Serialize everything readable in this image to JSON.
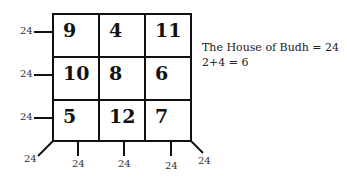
{
  "grid": {
    "cells": [
      [
        "9",
        "4",
        "11"
      ],
      [
        "10",
        "8",
        "6"
      ],
      [
        "5",
        "12",
        "7"
      ]
    ]
  },
  "side_labels": {
    "left": [
      "24",
      "24",
      "24"
    ],
    "bottom": [
      "24",
      "24",
      "24"
    ],
    "corner_left": "24",
    "corner_right": "24"
  },
  "note": {
    "line1": "The  House of Budh = 24",
    "line2": "2+4 = 6"
  }
}
